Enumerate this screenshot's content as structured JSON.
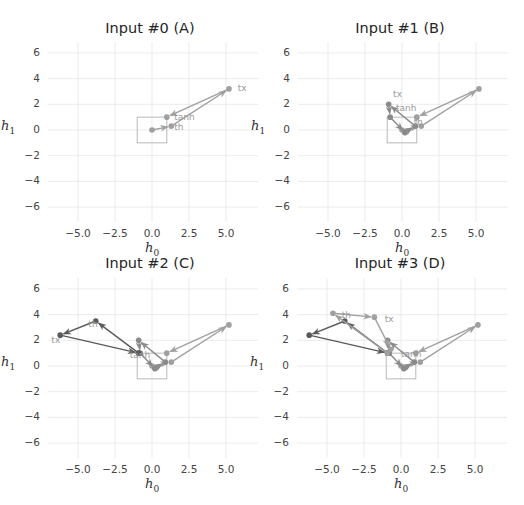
{
  "figure": {
    "xlabel": "h",
    "xlabel_sub": "0",
    "ylabel": "h",
    "ylabel_sub": "1",
    "xticks": [
      "−5.0",
      "−2.5",
      "0.0",
      "2.5",
      "5.0"
    ],
    "yticks": [
      "6",
      "4",
      "2",
      "0",
      "−2",
      "−4",
      "−6"
    ],
    "colors": {
      "grid": "#e6e6e6",
      "box": "#b8b8b8",
      "trace_light": "#a0a0a0",
      "trace_mid": "#8a8a8a",
      "trace_dark": "#5a5a5a",
      "label_text": "#9a9a9a",
      "title_text": "#262626"
    }
  },
  "panels": [
    {
      "title": "Input #0 (A)"
    },
    {
      "title": "Input #1 (B)"
    },
    {
      "title": "Input #2 (C)"
    },
    {
      "title": "Input #3 (D)"
    }
  ],
  "chart_data": [
    {
      "type": "line",
      "title": "Input #0 (A)",
      "xlabel": "h0",
      "ylabel": "h1",
      "xlim": [
        -7.2,
        7.2
      ],
      "ylim": [
        -7,
        7
      ],
      "xticks": [
        -5.0,
        -2.5,
        0.0,
        2.5,
        5.0
      ],
      "yticks": [
        -6,
        -4,
        -2,
        0,
        2,
        4,
        6
      ],
      "grid": true,
      "reference_box": {
        "x": [
          -1,
          1
        ],
        "y": [
          -1,
          1
        ]
      },
      "series": [
        {
          "name": "step A",
          "color": "#a0a0a0",
          "points": [
            [
              0.0,
              0.0
            ],
            [
              1.3,
              0.3
            ],
            [
              5.2,
              3.2
            ],
            [
              1.0,
              1.0
            ]
          ],
          "labels": [
            {
              "text": "th",
              "x": 1.5,
              "y": 0.0
            },
            {
              "text": "tx",
              "x": 5.8,
              "y": 3.0
            },
            {
              "text": "tanh",
              "x": 1.5,
              "y": 0.8
            }
          ]
        }
      ]
    },
    {
      "type": "line",
      "title": "Input #1 (B)",
      "xlabel": "h0",
      "ylabel": "h1",
      "xlim": [
        -7.2,
        7.2
      ],
      "ylim": [
        -7,
        7
      ],
      "xticks": [
        -5.0,
        -2.5,
        0.0,
        2.5,
        5.0
      ],
      "yticks": [
        -6,
        -4,
        -2,
        0,
        2,
        4,
        6
      ],
      "grid": true,
      "reference_box": {
        "x": [
          -1,
          1
        ],
        "y": [
          -1,
          1
        ]
      },
      "series": [
        {
          "name": "step A",
          "color": "#a0a0a0",
          "points": [
            [
              0.0,
              0.0
            ],
            [
              1.3,
              0.3
            ],
            [
              5.2,
              3.2
            ],
            [
              1.0,
              1.0
            ]
          ]
        },
        {
          "name": "step B",
          "color": "#8a8a8a",
          "points": [
            [
              0.2,
              -0.2
            ],
            [
              0.9,
              0.3
            ],
            [
              -0.9,
              2.0
            ],
            [
              -0.8,
              1.0
            ],
            [
              0.2,
              -0.2
            ]
          ],
          "labels": [
            {
              "text": "tx",
              "x": -0.6,
              "y": 2.6
            },
            {
              "text": "tanh",
              "x": -0.4,
              "y": 1.5
            },
            {
              "text": "th",
              "x": 0.8,
              "y": 0.4
            }
          ]
        }
      ]
    },
    {
      "type": "line",
      "title": "Input #2 (C)",
      "xlabel": "h0",
      "ylabel": "h1",
      "xlim": [
        -7.2,
        7.2
      ],
      "ylim": [
        -7,
        7
      ],
      "xticks": [
        -5.0,
        -2.5,
        0.0,
        2.5,
        5.0
      ],
      "yticks": [
        -6,
        -4,
        -2,
        0,
        2,
        4,
        6
      ],
      "grid": true,
      "reference_box": {
        "x": [
          -1,
          1
        ],
        "y": [
          -1,
          1
        ]
      },
      "series": [
        {
          "name": "step A",
          "color": "#a0a0a0",
          "points": [
            [
              0.0,
              0.0
            ],
            [
              1.3,
              0.3
            ],
            [
              5.2,
              3.2
            ],
            [
              1.0,
              1.0
            ]
          ]
        },
        {
          "name": "step B",
          "color": "#8a8a8a",
          "points": [
            [
              0.2,
              -0.2
            ],
            [
              0.9,
              0.3
            ],
            [
              -0.9,
              2.0
            ],
            [
              -0.8,
              1.0
            ],
            [
              0.2,
              -0.2
            ]
          ]
        },
        {
          "name": "step C",
          "color": "#5a5a5a",
          "points": [
            [
              -0.9,
              1.0
            ],
            [
              -3.8,
              3.5
            ],
            [
              -6.2,
              2.4
            ],
            [
              -0.9,
              1.0
            ]
          ],
          "labels": [
            {
              "text": "th",
              "x": -4.3,
              "y": 3.0
            },
            {
              "text": "tx",
              "x": -6.8,
              "y": 1.8
            },
            {
              "text": "tanh",
              "x": -1.5,
              "y": 0.6
            }
          ]
        }
      ]
    },
    {
      "type": "line",
      "title": "Input #3 (D)",
      "xlabel": "h0",
      "ylabel": "h1",
      "xlim": [
        -7.2,
        7.2
      ],
      "ylim": [
        -7,
        7
      ],
      "xticks": [
        -5.0,
        -2.5,
        0.0,
        2.5,
        5.0
      ],
      "yticks": [
        -6,
        -4,
        -2,
        0,
        2,
        4,
        6
      ],
      "grid": true,
      "reference_box": {
        "x": [
          -1,
          1
        ],
        "y": [
          -1,
          1
        ]
      },
      "series": [
        {
          "name": "step A",
          "color": "#a0a0a0",
          "points": [
            [
              0.0,
              0.0
            ],
            [
              1.3,
              0.3
            ],
            [
              5.2,
              3.2
            ],
            [
              1.0,
              1.0
            ]
          ]
        },
        {
          "name": "step B",
          "color": "#8a8a8a",
          "points": [
            [
              0.2,
              -0.2
            ],
            [
              0.9,
              0.3
            ],
            [
              -0.9,
              2.0
            ],
            [
              -0.8,
              1.0
            ],
            [
              0.2,
              -0.2
            ]
          ]
        },
        {
          "name": "step C",
          "color": "#5a5a5a",
          "points": [
            [
              -0.9,
              1.0
            ],
            [
              -3.8,
              3.5
            ],
            [
              -6.2,
              2.4
            ],
            [
              -0.9,
              1.0
            ]
          ]
        },
        {
          "name": "step D",
          "color": "#a0a0a0",
          "points": [
            [
              -0.9,
              1.0
            ],
            [
              -4.6,
              4.1
            ],
            [
              -1.8,
              3.8
            ],
            [
              -0.7,
              1.3
            ]
          ],
          "labels": [
            {
              "text": "th",
              "x": -4.0,
              "y": 3.7
            },
            {
              "text": "tx",
              "x": -1.1,
              "y": 3.4
            },
            {
              "text": "tanh",
              "x": 0.0,
              "y": 0.7
            }
          ]
        }
      ]
    }
  ]
}
